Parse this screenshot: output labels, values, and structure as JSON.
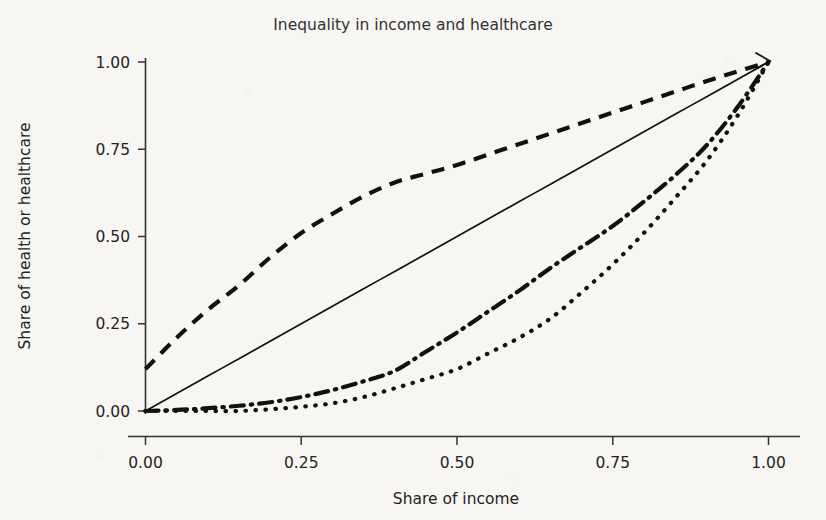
{
  "chart_data": {
    "type": "line",
    "title": "Inequality in income and healthcare",
    "xlabel": "Share of income",
    "ylabel": "Share of health or healthcare",
    "xlim": [
      0.0,
      1.0
    ],
    "ylim": [
      0.0,
      1.0
    ],
    "grid": false,
    "legend": "none",
    "xticks": [
      "0.00",
      "0.25",
      "0.50",
      "0.75",
      "1.00"
    ],
    "yticks": [
      "0.00",
      "0.25",
      "0.50",
      "0.75",
      "1.00"
    ],
    "xtick_values": [
      0.0,
      0.25,
      0.5,
      0.75,
      1.0
    ],
    "ytick_values": [
      0.0,
      0.25,
      0.5,
      0.75,
      1.0
    ],
    "annotations": [
      {
        "name": "arrowhead-at-equality-endpoint",
        "x": 1.0,
        "y": 1.0,
        "description": "arrowhead drawn at the top-right terminus of the line of equality"
      }
    ],
    "x": [
      0.0,
      0.05,
      0.1,
      0.15,
      0.2,
      0.25,
      0.3,
      0.35,
      0.4,
      0.45,
      0.5,
      0.55,
      0.6,
      0.65,
      0.7,
      0.75,
      0.8,
      0.85,
      0.9,
      0.95,
      1.0
    ],
    "series": [
      {
        "name": "Pro-poor concentration curve",
        "style": "dashed",
        "values": [
          0.12,
          0.21,
          0.29,
          0.36,
          0.44,
          0.51,
          0.565,
          0.615,
          0.655,
          0.68,
          0.705,
          0.735,
          0.765,
          0.795,
          0.825,
          0.855,
          0.885,
          0.915,
          0.945,
          0.973,
          1.0
        ]
      },
      {
        "name": "Line of equality",
        "style": "solid",
        "values": [
          0.0,
          0.05,
          0.1,
          0.15,
          0.2,
          0.25,
          0.3,
          0.35,
          0.4,
          0.45,
          0.5,
          0.55,
          0.6,
          0.65,
          0.7,
          0.75,
          0.8,
          0.85,
          0.9,
          0.95,
          1.0
        ]
      },
      {
        "name": "Pro-rich concentration curve (moderate)",
        "style": "dash-dot",
        "values": [
          0.0,
          0.003,
          0.008,
          0.015,
          0.025,
          0.04,
          0.06,
          0.085,
          0.115,
          0.17,
          0.225,
          0.285,
          0.345,
          0.41,
          0.47,
          0.53,
          0.6,
          0.675,
          0.76,
          0.87,
          1.0
        ]
      },
      {
        "name": "Pro-rich concentration curve (severe)",
        "style": "dotted",
        "values": [
          0.0,
          0.0,
          0.0,
          0.0,
          0.005,
          0.012,
          0.022,
          0.04,
          0.065,
          0.092,
          0.12,
          0.165,
          0.21,
          0.265,
          0.34,
          0.42,
          0.51,
          0.61,
          0.715,
          0.845,
          1.0
        ]
      }
    ]
  },
  "figure": {
    "background_color": "#f7f6f3",
    "ink_color": "#111111"
  }
}
